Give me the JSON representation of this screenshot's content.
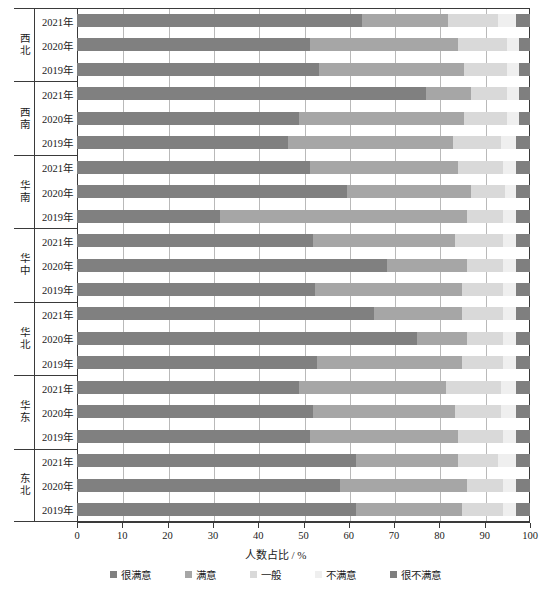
{
  "chart_data": {
    "type": "bar",
    "orientation": "horizontal",
    "stacked": true,
    "stack_percent": true,
    "title": "",
    "xlabel": "人数占比 / %",
    "ylabel": "",
    "xlim": [
      0,
      100
    ],
    "xticks": [
      "0",
      "10",
      "20",
      "30",
      "40",
      "50",
      "60",
      "70",
      "80",
      "90",
      "100"
    ],
    "grid": "vertical",
    "legend_position": "bottom",
    "series": [
      {
        "name": "很满意",
        "color": "#808080"
      },
      {
        "name": "满意",
        "color": "#a6a6a6"
      },
      {
        "name": "一般",
        "color": "#d9d9d9"
      },
      {
        "name": "不满意",
        "color": "#efefef"
      },
      {
        "name": "很不满意",
        "color": "#7f7f7f"
      }
    ],
    "groups": [
      {
        "region": "西北",
        "rows": [
          {
            "category": "2021年",
            "values": [
              63.0,
              19.0,
              11.0,
              4.0,
              3.0
            ]
          },
          {
            "category": "2020年",
            "values": [
              51.5,
              32.5,
              11.0,
              2.5,
              2.5
            ]
          },
          {
            "category": "2019年",
            "values": [
              53.5,
              32.0,
              9.5,
              2.5,
              2.5
            ]
          }
        ]
      },
      {
        "region": "西南",
        "rows": [
          {
            "category": "2021年",
            "values": [
              77.0,
              10.0,
              8.0,
              2.5,
              2.5
            ]
          },
          {
            "category": "2020年",
            "values": [
              49.0,
              36.5,
              9.5,
              2.5,
              2.5
            ]
          },
          {
            "category": "2019年",
            "values": [
              46.5,
              36.5,
              10.5,
              3.5,
              3.0
            ]
          }
        ]
      },
      {
        "region": "华南",
        "rows": [
          {
            "category": "2021年",
            "values": [
              51.5,
              32.5,
              10.0,
              3.0,
              3.0
            ]
          },
          {
            "category": "2020年",
            "values": [
              59.5,
              27.5,
              7.5,
              2.5,
              3.0
            ]
          },
          {
            "category": "2019年",
            "values": [
              31.5,
              54.5,
              8.0,
              3.0,
              3.0
            ]
          }
        ]
      },
      {
        "region": "华中",
        "rows": [
          {
            "category": "2021年",
            "values": [
              52.0,
              31.5,
              10.5,
              3.0,
              3.0
            ]
          },
          {
            "category": "2020年",
            "values": [
              68.5,
              17.5,
              8.0,
              3.0,
              3.0
            ]
          },
          {
            "category": "2019年",
            "values": [
              52.5,
              32.5,
              9.0,
              3.0,
              3.0
            ]
          }
        ]
      },
      {
        "region": "华北",
        "rows": [
          {
            "category": "2021年",
            "values": [
              65.5,
              19.5,
              9.0,
              3.0,
              3.0
            ]
          },
          {
            "category": "2020年",
            "values": [
              75.0,
              11.0,
              8.0,
              3.0,
              3.0
            ]
          },
          {
            "category": "2019年",
            "values": [
              53.0,
              32.0,
              9.0,
              3.0,
              3.0
            ]
          }
        ]
      },
      {
        "region": "华东",
        "rows": [
          {
            "category": "2021年",
            "values": [
              49.0,
              32.5,
              12.0,
              3.5,
              3.0
            ]
          },
          {
            "category": "2020年",
            "values": [
              52.0,
              31.5,
              10.0,
              3.5,
              3.0
            ]
          },
          {
            "category": "2019年",
            "values": [
              51.5,
              32.5,
              10.0,
              3.0,
              3.0
            ]
          }
        ]
      },
      {
        "region": "东北",
        "rows": [
          {
            "category": "2021年",
            "values": [
              61.5,
              22.5,
              9.0,
              4.0,
              3.0
            ]
          },
          {
            "category": "2020年",
            "values": [
              58.0,
              28.0,
              8.0,
              3.0,
              3.0
            ]
          },
          {
            "category": "2019年",
            "values": [
              61.5,
              23.5,
              9.0,
              3.0,
              3.0
            ]
          }
        ]
      }
    ]
  }
}
